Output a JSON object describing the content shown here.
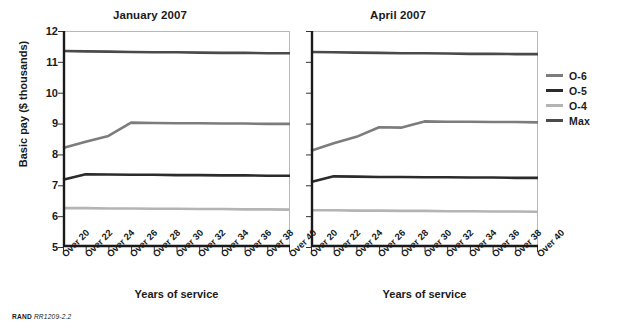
{
  "source_note": {
    "org": "RAND",
    "id": "RR1209-2.2"
  },
  "axis": {
    "ylabel": "Basic pay ($ thousands)",
    "xlabel": "Years of service",
    "yticks": [
      "12",
      "11",
      "10",
      "9",
      "8",
      "7",
      "6",
      "5"
    ],
    "xticks": [
      "Over 20",
      "Over 22",
      "Over 24",
      "Over 26",
      "Over 28",
      "Over 30",
      "Over 32",
      "Over 34",
      "Over 36",
      "Over 38",
      "Over 40"
    ]
  },
  "legend": {
    "position": "right",
    "entries": [
      {
        "label": "O-6",
        "color": "#7c7c7c"
      },
      {
        "label": "O-5",
        "color": "#2b2b2b"
      },
      {
        "label": "O-4",
        "color": "#b4b4b4"
      },
      {
        "label": "Max",
        "color": "#4a4a4a"
      }
    ]
  },
  "panels": [
    {
      "key": "jan",
      "title": "January 2007"
    },
    {
      "key": "apr",
      "title": "April 2007"
    }
  ],
  "chart_data": [
    {
      "type": "line",
      "title": "January 2007",
      "xlabel": "Years of service",
      "ylabel": "Basic pay ($ thousands)",
      "ylim": [
        5,
        12
      ],
      "grid": false,
      "legend_position": "right",
      "categories": [
        "Over 20",
        "Over 22",
        "Over 24",
        "Over 26",
        "Over 28",
        "Over 30",
        "Over 32",
        "Over 34",
        "Over 36",
        "Over 38",
        "Over 40"
      ],
      "series": [
        {
          "name": "Max",
          "color": "#4a4a4a",
          "values": [
            11.35,
            11.34,
            11.33,
            11.32,
            11.31,
            11.31,
            11.3,
            11.29,
            11.29,
            11.28,
            11.28
          ]
        },
        {
          "name": "O-6",
          "color": "#7c7c7c",
          "values": [
            8.21,
            8.41,
            8.6,
            9.03,
            9.02,
            9.01,
            9.01,
            9.0,
            9.0,
            8.99,
            8.99
          ]
        },
        {
          "name": "O-5",
          "color": "#2b2b2b",
          "values": [
            7.18,
            7.36,
            7.35,
            7.34,
            7.34,
            7.33,
            7.33,
            7.32,
            7.32,
            7.31,
            7.31
          ]
        },
        {
          "name": "O-4",
          "color": "#b4b4b4",
          "values": [
            6.26,
            6.26,
            6.25,
            6.25,
            6.24,
            6.24,
            6.23,
            6.23,
            6.22,
            6.22,
            6.21
          ]
        }
      ]
    },
    {
      "type": "line",
      "title": "April 2007",
      "xlabel": "Years of service",
      "ylabel": "Basic pay ($ thousands)",
      "ylim": [
        5,
        12
      ],
      "grid": false,
      "legend_position": "right",
      "categories": [
        "Over 20",
        "Over 22",
        "Over 24",
        "Over 26",
        "Over 28",
        "Over 30",
        "Over 32",
        "Over 34",
        "Over 36",
        "Over 38",
        "Over 40"
      ],
      "series": [
        {
          "name": "Max",
          "color": "#4a4a4a",
          "values": [
            11.32,
            11.31,
            11.3,
            11.29,
            11.28,
            11.28,
            11.27,
            11.26,
            11.26,
            11.25,
            11.25
          ]
        },
        {
          "name": "O-6",
          "color": "#7c7c7c",
          "values": [
            8.12,
            8.36,
            8.57,
            8.88,
            8.87,
            9.07,
            9.06,
            9.06,
            9.05,
            9.05,
            9.04
          ]
        },
        {
          "name": "O-5",
          "color": "#2b2b2b",
          "values": [
            7.11,
            7.29,
            7.28,
            7.27,
            7.27,
            7.26,
            7.26,
            7.25,
            7.25,
            7.24,
            7.24
          ]
        },
        {
          "name": "O-4",
          "color": "#b4b4b4",
          "values": [
            6.19,
            6.19,
            6.18,
            6.18,
            6.17,
            6.17,
            6.16,
            6.16,
            6.15,
            6.15,
            6.14
          ]
        }
      ]
    }
  ]
}
